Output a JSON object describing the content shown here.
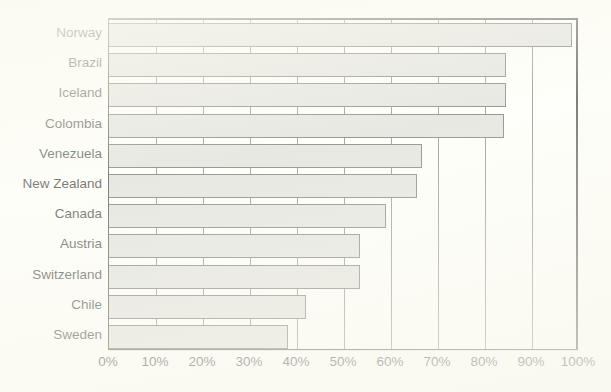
{
  "title": {
    "text": "clipped-title",
    "visible_fragment": ""
  },
  "chart_data": {
    "type": "bar",
    "orientation": "horizontal",
    "title": "",
    "xlabel": "",
    "ylabel": "",
    "categories": [
      "Norway",
      "Brazil",
      "Iceland",
      "Colombia",
      "Venezuela",
      "New Zealand",
      "Canada",
      "Austria",
      "Switzerland",
      "Chile",
      "Sweden"
    ],
    "values": [
      98.5,
      84.5,
      84.5,
      84,
      66.5,
      65.5,
      59,
      53.5,
      53.5,
      42,
      38
    ],
    "value_unit": "%",
    "xlim": [
      0,
      100
    ],
    "xticks": [
      0,
      10,
      20,
      30,
      40,
      50,
      60,
      70,
      80,
      90,
      100
    ],
    "xticklabels": [
      "0%",
      "10%",
      "20%",
      "30%",
      "40%",
      "50%",
      "60%",
      "70%",
      "80%",
      "90%",
      "100%"
    ],
    "grid": "vertical",
    "legend": null,
    "bar_fill_color": "#d9d9d4",
    "bar_border_color": "#55554f",
    "gridline_color": "#6f6f68",
    "axis_color": "#2b2b28",
    "background_color": "#fdfdf7"
  }
}
